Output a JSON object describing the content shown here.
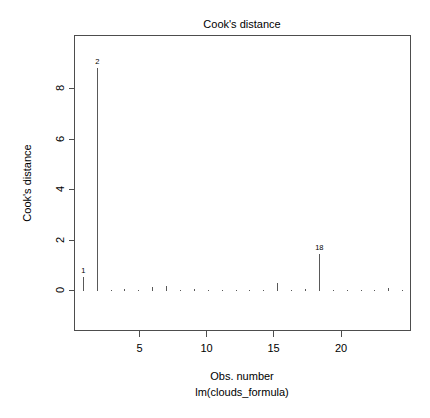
{
  "figure": {
    "title": "Cook's distance",
    "xlabel": "Obs. number",
    "sublabel": "lm(clouds_formula)",
    "ylabel": "Cook's distance"
  },
  "chart_data": {
    "type": "bar",
    "title": "Cook's distance",
    "xlabel": "Obs. number",
    "sublabel": "lm(clouds_formula)",
    "ylabel": "Cook's distance",
    "grid": false,
    "legend": null,
    "xlim": [
      0.4,
      24.6
    ],
    "ylim": [
      -0.35,
      9.4
    ],
    "xticks": [
      5,
      10,
      15,
      20
    ],
    "yticks": [
      0,
      2,
      4,
      6,
      8
    ],
    "xtick_labels": [
      "5",
      "10",
      "15",
      "20"
    ],
    "ytick_labels": [
      "0",
      "2",
      "4",
      "6",
      "8"
    ],
    "categories": [
      1,
      2,
      3,
      4,
      5,
      6,
      7,
      8,
      9,
      10,
      11,
      12,
      13,
      14,
      15,
      16,
      17,
      18,
      19,
      20,
      21,
      22,
      23,
      24
    ],
    "values": [
      0.55,
      8.8,
      0.03,
      0.05,
      0.02,
      0.15,
      0.18,
      0.03,
      0.04,
      0.03,
      0.03,
      0.02,
      0.03,
      0.03,
      0.3,
      0.03,
      0.05,
      1.45,
      0.03,
      0.02,
      0.03,
      0.03,
      0.08,
      0.03
    ],
    "annotations": [
      {
        "label": "1",
        "x": 1,
        "y": 0.55
      },
      {
        "label": "2",
        "x": 2,
        "y": 8.8
      },
      {
        "label": "18",
        "x": 18,
        "y": 1.45
      }
    ]
  },
  "colors": {
    "stem": "#595959",
    "axis": "#4d4d4d",
    "text": "#000000",
    "background": "#ffffff"
  }
}
